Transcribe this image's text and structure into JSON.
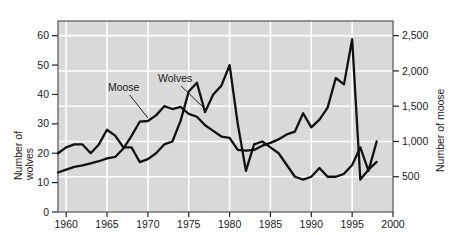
{
  "chart_data": {
    "type": "line",
    "title": "",
    "subtitle": "",
    "xlabel": "",
    "ylabel": "Number of wolves",
    "ylabel_right": "Number of moose",
    "ylabel_left_line1": "Number of",
    "ylabel_left_line2": "wolves",
    "xlim": [
      1959,
      2000
    ],
    "ylim_left": [
      0,
      65
    ],
    "ylim_right": [
      0,
      2708
    ],
    "xticks": [
      1960,
      1965,
      1970,
      1975,
      1980,
      1985,
      1990,
      1995,
      2000
    ],
    "xtick_labels": [
      "1960",
      "1965",
      "1970",
      "1975",
      "1980",
      "1985",
      "1990",
      "1995",
      "2000"
    ],
    "yticks_left": [
      0,
      10,
      20,
      30,
      40,
      50,
      60
    ],
    "ytick_labels_left": [
      "0",
      "10",
      "20",
      "30",
      "40",
      "50",
      "60"
    ],
    "yticks_right": [
      500,
      1000,
      1500,
      2000,
      2500
    ],
    "ytick_labels_right": [
      "500",
      "1,000",
      "1,500",
      "2,000",
      "2,500"
    ],
    "grid": true,
    "grid_color": "#ffffff",
    "plot_background": "#d9d9d9",
    "line_color": "#111111",
    "legend_position": "inline-annotations",
    "annotations": [
      {
        "text": "Moose",
        "x": 1969.0,
        "y_axis": "right",
        "pointer_to_x": 1970.4
      },
      {
        "text": "Wolves",
        "x": 1975.3,
        "y_axis": "left",
        "pointer_to_x": 1976.8
      }
    ],
    "series": [
      {
        "name": "Moose",
        "axis": "right",
        "label": "Moose",
        "x": [
          1959,
          1960,
          1961,
          1962,
          1963,
          1964,
          1965,
          1966,
          1967,
          1968,
          1969,
          1970,
          1971,
          1972,
          1973,
          1974,
          1975,
          1976,
          1977,
          1978,
          1979,
          1980,
          1981,
          1982,
          1983,
          1984,
          1985,
          1986,
          1987,
          1988,
          1989,
          1990,
          1991,
          1992,
          1993,
          1994,
          1995,
          1996,
          1997,
          1998
        ],
        "values": [
          560,
          600,
          640,
          660,
          690,
          720,
          760,
          780,
          900,
          1080,
          1280,
          1290,
          1370,
          1500,
          1460,
          1490,
          1390,
          1350,
          1230,
          1150,
          1070,
          1050,
          880,
          870,
          880,
          940,
          980,
          1030,
          1100,
          1140,
          1400,
          1200,
          1310,
          1480,
          1900,
          1810,
          2450,
          460,
          600,
          710
        ]
      },
      {
        "name": "Wolves",
        "axis": "left",
        "label": "Wolves",
        "x": [
          1959,
          1960,
          1961,
          1962,
          1963,
          1964,
          1965,
          1966,
          1967,
          1968,
          1969,
          1970,
          1971,
          1972,
          1973,
          1974,
          1975,
          1976,
          1977,
          1978,
          1979,
          1980,
          1981,
          1982,
          1983,
          1984,
          1985,
          1986,
          1987,
          1988,
          1989,
          1990,
          1991,
          1992,
          1993,
          1994,
          1995,
          1996,
          1997,
          1998
        ],
        "values": [
          20,
          22,
          23,
          23,
          20,
          23,
          28,
          26,
          22,
          22,
          17,
          18,
          20,
          23,
          24,
          31,
          41,
          44,
          34,
          40,
          43,
          50,
          30,
          14,
          23,
          24,
          22,
          20,
          16,
          12,
          11,
          12,
          15,
          12,
          12,
          13,
          16,
          22,
          14,
          24
        ]
      }
    ]
  },
  "axes": {
    "left_title_lines": [
      "Number of",
      "wolves"
    ],
    "right_title": "Number of moose"
  }
}
